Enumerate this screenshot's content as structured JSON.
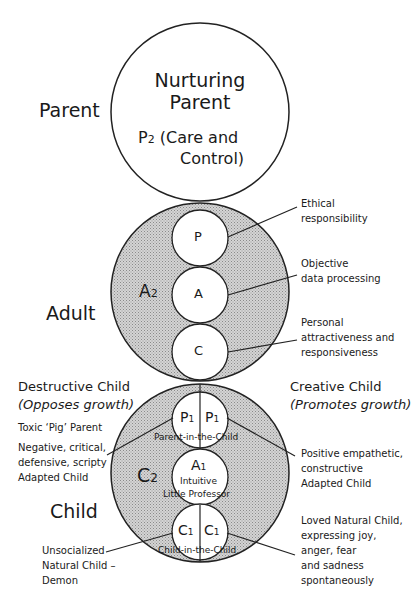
{
  "diagram": {
    "type": "ego-state structural diagram",
    "parent": {
      "label": "Parent",
      "circle_title_line1": "Nurturing",
      "circle_title_line2": "Parent",
      "sub_line1": "P",
      "sub_sub": "2",
      "sub_line1_rest": " (Care and",
      "sub_line2": "Control)"
    },
    "adult": {
      "label": "Adult",
      "inner_label": "A",
      "inner_sub": "2",
      "circles": [
        {
          "letter": "P",
          "annotation_line1": "Ethical",
          "annotation_line2": "responsibility"
        },
        {
          "letter": "A",
          "annotation_line1": "Objective",
          "annotation_line2": "data processing"
        },
        {
          "letter": "C",
          "annotation_line1": "Personal",
          "annotation_line2": "attractiveness and",
          "annotation_line3": "responsiveness"
        }
      ]
    },
    "child": {
      "label": "Child",
      "inner_label": "C",
      "inner_sub": "2",
      "destructive": {
        "title": "Destructive Child",
        "subtitle": "(Opposes growth)",
        "note": "Toxic ‘Pig’ Parent",
        "adapted_line1": "Negative, critical,",
        "adapted_line2": "defensive, scripty",
        "adapted_line3": "Adapted Child",
        "natural_line1": "Unsocialized",
        "natural_line2": "Natural Child –",
        "natural_line3": "Demon"
      },
      "creative": {
        "title": "Creative Child",
        "subtitle": "(Promotes growth)",
        "adapted_line1": "Positive empathetic,",
        "adapted_line2": "constructive",
        "adapted_line3": "Adapted Child",
        "natural_line1": "Loved Natural Child,",
        "natural_line2": "expressing joy,",
        "natural_line3": "anger, fear",
        "natural_line4": "and sadness",
        "natural_line5": "spontaneously"
      },
      "p1": {
        "letter": "P",
        "sub": "1",
        "caption": "Parent-in-the-Child"
      },
      "a1": {
        "letter": "A",
        "sub": "1",
        "caption_line1": "Intuitive",
        "caption_line2": "Little Professor"
      },
      "c1": {
        "letter": "C",
        "sub": "1",
        "caption": "Child-in-the-Child"
      }
    },
    "colors": {
      "stroke": "#222222",
      "fill_shaded": "#c8c8c8",
      "fill_white": "#ffffff"
    }
  }
}
